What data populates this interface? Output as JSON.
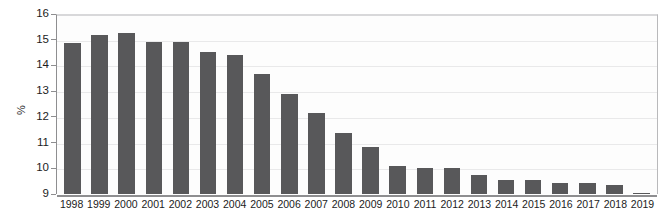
{
  "chart_data": {
    "type": "bar",
    "title": "",
    "xlabel": "",
    "ylabel": "%",
    "ylim": [
      9,
      16
    ],
    "yticks": [
      9,
      10,
      11,
      12,
      13,
      14,
      15,
      16
    ],
    "grid": true,
    "legend": "none",
    "bar_color": "#58585a",
    "categories": [
      "1998",
      "1999",
      "2000",
      "2001",
      "2002",
      "2003",
      "2004",
      "2005",
      "2006",
      "2007",
      "2008",
      "2009",
      "2010",
      "2011",
      "2012",
      "2013",
      "2014",
      "2015",
      "2016",
      "2017",
      "2018",
      "2019"
    ],
    "values": [
      14.9,
      15.2,
      15.3,
      14.95,
      14.95,
      14.55,
      14.45,
      13.7,
      12.9,
      12.15,
      11.4,
      10.85,
      10.1,
      10.0,
      10.0,
      9.75,
      9.55,
      9.55,
      9.45,
      9.45,
      9.35,
      9.05
    ]
  }
}
